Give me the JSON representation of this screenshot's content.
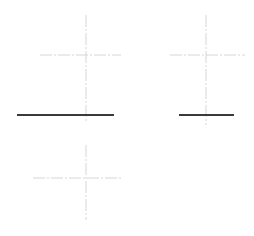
{
  "drawing": {
    "background": "#ffffff",
    "centerline_color": "#d6d6d6",
    "edge_color": "#3a3a3a",
    "views": [
      {
        "name": "front-view",
        "centerlines": [
          {
            "x1": 86,
            "y1": 15,
            "x2": 86,
            "y2": 123
          },
          {
            "x1": 40,
            "y1": 55,
            "x2": 121,
            "y2": 55
          }
        ],
        "edges": [
          {
            "x1": 17,
            "y1": 115,
            "x2": 114,
            "y2": 115
          }
        ]
      },
      {
        "name": "side-view",
        "centerlines": [
          {
            "x1": 206,
            "y1": 15,
            "x2": 206,
            "y2": 125
          },
          {
            "x1": 170,
            "y1": 55,
            "x2": 245,
            "y2": 55
          }
        ],
        "edges": [
          {
            "x1": 179,
            "y1": 115,
            "x2": 234,
            "y2": 115
          }
        ]
      },
      {
        "name": "top-view",
        "centerlines": [
          {
            "x1": 86,
            "y1": 145,
            "x2": 86,
            "y2": 220
          },
          {
            "x1": 33,
            "y1": 178,
            "x2": 123,
            "y2": 178
          }
        ],
        "edges": []
      }
    ]
  }
}
